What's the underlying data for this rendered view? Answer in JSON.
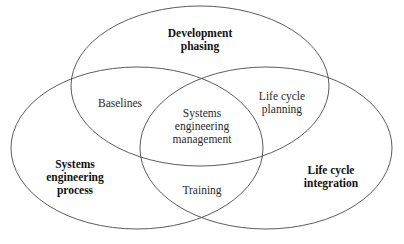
{
  "diagram": {
    "type": "venn",
    "stroke_color": "#4a4a4a",
    "background": "#ffffff",
    "sets": [
      {
        "id": "top",
        "lines": [
          "Development",
          "phasing"
        ],
        "bold": true
      },
      {
        "id": "left",
        "lines": [
          "Systems",
          "engineering",
          "process"
        ],
        "bold": true
      },
      {
        "id": "right",
        "lines": [
          "Life cycle",
          "integration"
        ],
        "bold": true
      }
    ],
    "intersections": [
      {
        "id": "top-left",
        "lines": [
          "Baselines"
        ]
      },
      {
        "id": "top-right",
        "lines": [
          "Life cycle",
          "planning"
        ]
      },
      {
        "id": "left-right",
        "lines": [
          "Training"
        ]
      },
      {
        "id": "center",
        "lines": [
          "Systems",
          "engineering",
          "management"
        ]
      }
    ]
  }
}
